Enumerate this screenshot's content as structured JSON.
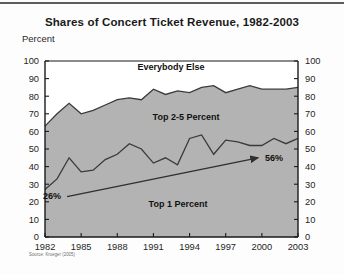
{
  "figure": {
    "title": "Shares of Concert Ticket Revenue, 1982-2003",
    "unit_label": "Percent",
    "source_note": "Source: Krueger (2005)"
  },
  "labels": {
    "band_top": "Everybody Else",
    "band_middle": "Top 2-5 Percent",
    "band_bottom": "Top 1 Percent",
    "start_value": "26%",
    "end_value": "56%"
  },
  "colors": {
    "band_fill": "#b3b3b3",
    "line": "#3a3a3a",
    "axis": "#1a1a1a",
    "background": "#ffffff",
    "text": "#111111"
  },
  "chart_data": {
    "type": "area",
    "title": "Shares of Concert Ticket Revenue, 1982-2003",
    "xlabel": "",
    "ylabel": "Percent",
    "ylim": [
      0,
      100
    ],
    "xlim": [
      1982,
      2003
    ],
    "ytick_step": 10,
    "grid": false,
    "legend_position": "inline-annotations",
    "dual_axis": true,
    "yticks": [
      0,
      10,
      20,
      30,
      40,
      50,
      60,
      70,
      80,
      90,
      100
    ],
    "yticks_right": [
      0,
      10,
      20,
      30,
      40,
      50,
      60,
      70,
      80,
      90,
      100
    ],
    "xticks": [
      1982,
      1985,
      1988,
      1991,
      1994,
      1997,
      2000,
      2003
    ],
    "x": [
      1982,
      1983,
      1984,
      1985,
      1986,
      1987,
      1988,
      1989,
      1990,
      1991,
      1992,
      1993,
      1994,
      1995,
      1996,
      1997,
      1998,
      1999,
      2000,
      2001,
      2002,
      2003
    ],
    "series": [
      {
        "name": "Top 1 Percent",
        "values": [
          27,
          33,
          45,
          37,
          38,
          44,
          47,
          53,
          50,
          42,
          45,
          41,
          56,
          58,
          47,
          55,
          54,
          52,
          52,
          56,
          53,
          56
        ]
      },
      {
        "name": "Top 5 Percent (Top 1 + Top 2-5)",
        "values": [
          63,
          70,
          76,
          70,
          72,
          75,
          78,
          79,
          78,
          84,
          81,
          83,
          82,
          85,
          86,
          82,
          84,
          86,
          84,
          84,
          84,
          85
        ]
      }
    ],
    "bands": [
      {
        "name": "Top 1 Percent",
        "fill": "#b3b3b3",
        "from": "baseline",
        "to": "Top 1 Percent"
      },
      {
        "name": "Top 2-5 Percent",
        "fill": "#b3b3b3",
        "from": "Top 1 Percent",
        "to": "Top 5 Percent"
      },
      {
        "name": "Everybody Else",
        "fill": "#ffffff",
        "from": "Top 5 Percent",
        "to": "100"
      }
    ],
    "annotations": [
      {
        "text": "26%",
        "x": 1982,
        "y": 23,
        "role": "trend-arrow-start"
      },
      {
        "text": "56%",
        "x": 2003,
        "y": 45,
        "role": "trend-arrow-end"
      },
      {
        "text": "Everybody Else",
        "x": 1991,
        "y": 93,
        "role": "band-label"
      },
      {
        "text": "Top 2-5 Percent",
        "x": 1990,
        "y": 67,
        "role": "band-label"
      },
      {
        "text": "Top 1 Percent",
        "x": 1991,
        "y": 19,
        "role": "band-label"
      }
    ]
  }
}
